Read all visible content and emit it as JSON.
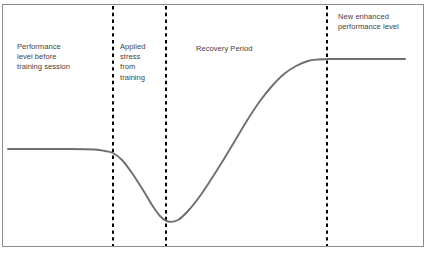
{
  "figure": {
    "name": "supercompensation-training-response-curve",
    "background_color": "#ffffff",
    "frame_border_color": "#8c8c8c",
    "curve_color": "#6e6e6e",
    "divider_color": "#000000",
    "text_color": "#3f3f3f"
  },
  "labels": {
    "baseline": "Performance\nlevel before\ntraining session",
    "stress": "Applied\nstress\nfrom\ntraining",
    "recovery": "Recovery Period",
    "enhanced": "New enhanced\nperformance level"
  },
  "chart_data": {
    "type": "line",
    "title": "",
    "xlabel": "",
    "ylabel": "",
    "grid": false,
    "legend": "none",
    "xlim": [
      0,
      434
    ],
    "ylim": [
      0,
      254
    ],
    "axis_inverted_y": true,
    "series": [
      {
        "name": "performance-level",
        "color": "#6e6e6e",
        "stroke_width": 1.9,
        "points": [
          [
            8,
            149
          ],
          [
            40,
            149
          ],
          [
            70,
            149
          ],
          [
            95,
            149.5
          ],
          [
            105,
            151
          ],
          [
            113,
            153
          ],
          [
            122,
            160
          ],
          [
            132,
            173
          ],
          [
            143,
            190
          ],
          [
            152,
            205
          ],
          [
            160,
            216
          ],
          [
            168,
            221.5
          ],
          [
            178,
            220
          ],
          [
            188,
            211
          ],
          [
            200,
            196
          ],
          [
            212,
            178
          ],
          [
            224,
            159
          ],
          [
            236,
            139
          ],
          [
            248,
            119
          ],
          [
            260,
            101
          ],
          [
            272,
            86
          ],
          [
            284,
            74
          ],
          [
            296,
            66
          ],
          [
            308,
            61
          ],
          [
            318,
            59.5
          ],
          [
            330,
            59
          ],
          [
            360,
            59
          ],
          [
            405,
            59
          ]
        ]
      }
    ],
    "dividers": [
      {
        "name": "divider-onset-of-stress",
        "x": 113,
        "y_top": 6,
        "y_bottom": 246,
        "style": "dashed",
        "color": "#000000",
        "width": 2
      },
      {
        "name": "divider-end-of-stress",
        "x": 166,
        "y_top": 6,
        "y_bottom": 246,
        "style": "dashed",
        "color": "#000000",
        "width": 2
      },
      {
        "name": "divider-supercompensation-onset",
        "x": 327,
        "y_top": 6,
        "y_bottom": 246,
        "style": "dashed",
        "color": "#000000",
        "width": 2
      }
    ],
    "annotations": [
      {
        "name": "phase-baseline",
        "text": "Performance level before training session",
        "x": 17,
        "y": 42
      },
      {
        "name": "phase-stress",
        "text": "Applied stress from training",
        "x": 120,
        "y": 42
      },
      {
        "name": "phase-recovery",
        "text": "Recovery Period",
        "x": 196,
        "y": 44
      },
      {
        "name": "phase-enhanced",
        "text": "New enhanced performance level",
        "x": 338,
        "y": 12
      }
    ],
    "key_levels": {
      "baseline_performance_y": 149,
      "fatigue_trough_y": 221.5,
      "supercompensated_level_y": 59
    }
  }
}
